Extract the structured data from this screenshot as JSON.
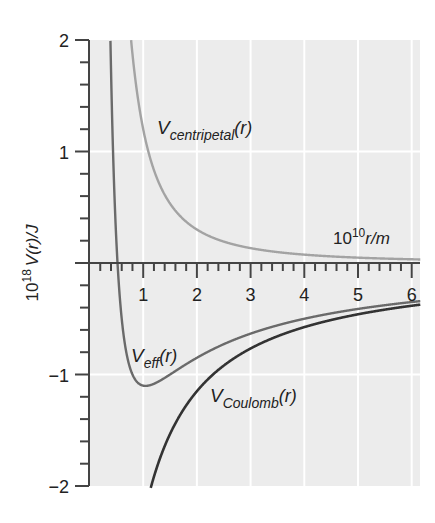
{
  "chart_data": {
    "type": "line",
    "title": "",
    "xlabel": "10^10 r/m",
    "xlabel_base": "10",
    "xlabel_exp": "10",
    "xlabel_rest": "r/m",
    "ylabel": "10^18 V(r)/J",
    "ylabel_base": "10",
    "ylabel_exp": "18",
    "ylabel_rest": "V(r)/J",
    "xlim": [
      0,
      6.15
    ],
    "ylim": [
      -2,
      2
    ],
    "xticks": [
      "1",
      "2",
      "3",
      "4",
      "5",
      "6"
    ],
    "yticks": [
      "2",
      "1",
      "−1",
      "−2"
    ],
    "grid": true,
    "legend": "inline labels",
    "series": [
      {
        "name": "V_centripetal(r)",
        "label_main": "V",
        "label_sub": "centripetal",
        "label_arg": "(r)",
        "formula": "1.2 / r^2",
        "color": "#a3a3a3",
        "x": [
          0.77,
          1.0,
          1.5,
          2.0,
          3.0,
          4.0,
          5.0,
          6.0
        ],
        "values": [
          2.0,
          1.2,
          0.53,
          0.3,
          0.13,
          0.075,
          0.048,
          0.033
        ]
      },
      {
        "name": "V_eff(r)",
        "label_main": "V",
        "label_sub": "eff",
        "label_arg": "(r)",
        "formula": "1.2 / r^2 - 2.3 / r",
        "color": "#6a6a6a",
        "x": [
          0.39,
          0.52,
          0.7,
          1.04,
          1.5,
          2.0,
          3.0,
          4.0,
          5.0,
          6.0
        ],
        "values": [
          2.0,
          0.0,
          -0.84,
          -1.1,
          -1.0,
          -0.85,
          -0.63,
          -0.5,
          -0.41,
          -0.35
        ]
      },
      {
        "name": "V_Coulomb(r)",
        "label_main": "V",
        "label_sub": "Coulomb",
        "label_arg": "(r)",
        "formula": "-2.3 / r",
        "color": "#333333",
        "x": [
          1.15,
          1.5,
          2.0,
          3.0,
          4.0,
          5.0,
          6.0
        ],
        "values": [
          -2.0,
          -1.53,
          -1.15,
          -0.77,
          -0.58,
          -0.46,
          -0.38
        ]
      }
    ]
  },
  "colors": {
    "plot_bg": "#ececec",
    "grid": "#ffffff",
    "axis": "#444444"
  }
}
